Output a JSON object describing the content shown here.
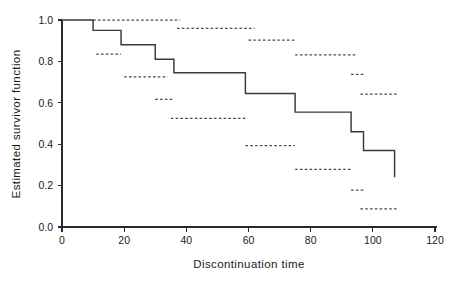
{
  "chart_data": {
    "type": "line",
    "title": "",
    "xlabel": "Discontinuation time",
    "ylabel": "Estimated survivor function",
    "xlim": [
      0,
      120
    ],
    "ylim": [
      0.0,
      1.0
    ],
    "xticks": [
      0,
      20,
      40,
      60,
      80,
      100,
      120
    ],
    "xtick_labels": [
      "0",
      "20",
      "40",
      "60",
      "80",
      "100",
      "120"
    ],
    "yticks": [
      0.0,
      0.2,
      0.4,
      0.6,
      0.8,
      1.0
    ],
    "ytick_labels": [
      "0.0",
      "0.2",
      "0.4",
      "0.6",
      "0.8",
      "1.0"
    ],
    "grid": false,
    "legend": false,
    "legend_position": "none",
    "series": [
      {
        "name": "Kaplan-Meier estimate",
        "style": "step-post",
        "linestyle": "solid",
        "color": "#3a3a3a",
        "x": [
          0,
          10,
          19,
          30,
          36,
          59,
          75,
          93,
          97,
          107
        ],
        "y": [
          1.0,
          0.95,
          0.88,
          0.81,
          0.745,
          0.645,
          0.555,
          0.46,
          0.37,
          0.37
        ],
        "final_drop_to": 0.24,
        "final_drop_x": 107
      },
      {
        "name": "Pointwise confidence limits",
        "style": "horizontal-segments",
        "linestyle": "dashed",
        "color": "#4a4a4a",
        "segments": [
          {
            "x0": 10,
            "x1": 38,
            "y": 1.0
          },
          {
            "x0": 37,
            "x1": 62,
            "y": 0.96
          },
          {
            "x0": 11,
            "x1": 19,
            "y": 0.835
          },
          {
            "x0": 20,
            "x1": 34,
            "y": 0.725
          },
          {
            "x0": 30,
            "x1": 36,
            "y": 0.617
          },
          {
            "x0": 35,
            "x1": 59,
            "y": 0.525
          },
          {
            "x0": 60,
            "x1": 75,
            "y": 0.903
          },
          {
            "x0": 59,
            "x1": 75,
            "y": 0.393
          },
          {
            "x0": 75,
            "x1": 95,
            "y": 0.832
          },
          {
            "x0": 75,
            "x1": 93,
            "y": 0.278
          },
          {
            "x0": 93,
            "x1": 97,
            "y": 0.737
          },
          {
            "x0": 96,
            "x1": 108,
            "y": 0.642
          },
          {
            "x0": 93,
            "x1": 97,
            "y": 0.178
          },
          {
            "x0": 96,
            "x1": 108,
            "y": 0.087
          }
        ]
      }
    ]
  },
  "axes": {
    "x_label": "Discontinuation time",
    "y_label": "Estimated survivor function"
  }
}
